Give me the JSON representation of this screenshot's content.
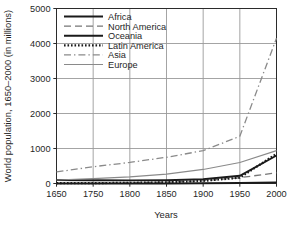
{
  "chart_data": {
    "type": "line",
    "title": "",
    "xlabel": "Years",
    "ylabel": "World population, 1650–2000 (in millions)",
    "xlim": [
      1650,
      2000
    ],
    "ylim": [
      0,
      5000
    ],
    "grid": true,
    "legend_position": "top-left-inside",
    "xticks": [
      1650,
      1750,
      1800,
      1850,
      1900,
      1950,
      2000
    ],
    "xtick_labels": [
      "1650",
      "1750",
      "1800",
      "1850",
      "1900",
      "1950",
      "2000"
    ],
    "yticks": [
      0,
      1000,
      2000,
      3000,
      4000,
      5000
    ],
    "ytick_labels": [
      "0",
      "1000",
      "2000",
      "3000",
      "4000",
      "5000"
    ],
    "x": [
      1650,
      1750,
      1800,
      1850,
      1900,
      1950,
      2000
    ],
    "series": [
      {
        "name": "Africa",
        "style": "solid",
        "color": "#1a1a1a",
        "width": 1.9,
        "values": [
          100,
          95,
          90,
          95,
          120,
          220,
          800
        ]
      },
      {
        "name": "North America",
        "style": "dashed",
        "color": "#767676",
        "width": 1.3,
        "values": [
          5,
          5,
          16,
          39,
          82,
          166,
          307
        ]
      },
      {
        "name": "Oceania",
        "style": "solid",
        "color": "#1a1a1a",
        "width": 1.9,
        "values": [
          2,
          2,
          2,
          2,
          6,
          13,
          31
        ]
      },
      {
        "name": "Latin America",
        "style": "dotted",
        "color": "#1a1a1a",
        "width": 2.2,
        "values": [
          12,
          11,
          19,
          33,
          74,
          166,
          850
        ]
      },
      {
        "name": "Asia",
        "style": "dashdot",
        "color": "#8a8a8a",
        "width": 1.3,
        "values": [
          330,
          479,
          602,
          749,
          937,
          1350,
          4150
        ]
      },
      {
        "name": "Europe",
        "style": "solid",
        "color": "#8a8a8a",
        "width": 1.2,
        "values": [
          100,
          140,
          187,
          266,
          401,
          600,
          940
        ]
      }
    ]
  },
  "legend": {
    "entries": [
      {
        "label": "Africa"
      },
      {
        "label": "North America"
      },
      {
        "label": "Oceania"
      },
      {
        "label": "Latin America"
      },
      {
        "label": "Asia"
      },
      {
        "label": "Europe"
      }
    ]
  },
  "axes": {
    "x_title": "Years",
    "y_title": "World population, 1650–2000 (in millions)"
  },
  "colors": {
    "frame": "#2b2b2b",
    "grid": "#9a9a9a",
    "background": "#ffffff",
    "text": "#1f1f1f"
  }
}
